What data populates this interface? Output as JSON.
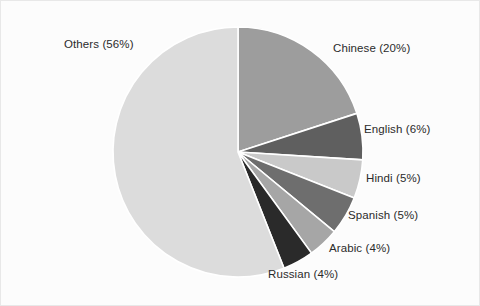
{
  "chart_data": {
    "type": "pie",
    "title": "",
    "subtitle": "",
    "xlabel": "",
    "ylabel": "",
    "legend_position": "none",
    "grid": false,
    "labels_inline": true,
    "start_angle_deg": 0,
    "direction": "clockwise",
    "categories": [
      "Chinese",
      "English",
      "Hindi",
      "Spanish",
      "Arabic",
      "Russian",
      "Others"
    ],
    "values": [
      20,
      6,
      5,
      5,
      4,
      4,
      56
    ],
    "unit": "%",
    "slices": [
      {
        "name": "Chinese",
        "value": 20,
        "label": "Chinese (20%)",
        "color": "#9d9d9d"
      },
      {
        "name": "English",
        "value": 6,
        "label": "English (6%)",
        "color": "#5f5f5f"
      },
      {
        "name": "Hindi",
        "value": 5,
        "label": "Hindi (5%)",
        "color": "#c9c9c9"
      },
      {
        "name": "Spanish",
        "value": 5,
        "label": "Spanish (5%)",
        "color": "#6e6e6e"
      },
      {
        "name": "Arabic",
        "value": 4,
        "label": "Arabic (4%)",
        "color": "#a6a6a6"
      },
      {
        "name": "Russian",
        "value": 4,
        "label": "Russian (4%)",
        "color": "#2a2a2a"
      },
      {
        "name": "Others",
        "value": 56,
        "label": "Others (56%)",
        "color": "#dcdcdc"
      }
    ],
    "annotations": [
      {
        "text": "Others (56%)",
        "x": 64,
        "y": 39
      },
      {
        "text": "Chinese (20%)",
        "x": 333,
        "y": 43
      },
      {
        "text": "English (6%)",
        "x": 364,
        "y": 124
      },
      {
        "text": "Hindi (5%)",
        "x": 366,
        "y": 173
      },
      {
        "text": "Spanish (5%)",
        "x": 348,
        "y": 210
      },
      {
        "text": "Arabic (4%)",
        "x": 329,
        "y": 243
      },
      {
        "text": "Russian (4%)",
        "x": 268,
        "y": 269
      }
    ],
    "background_color": "#fcfcfc",
    "text_color": "#2b2b2b",
    "separator_color": "#ffffff",
    "center": {
      "x": 238,
      "y": 152
    },
    "radius": 125
  }
}
